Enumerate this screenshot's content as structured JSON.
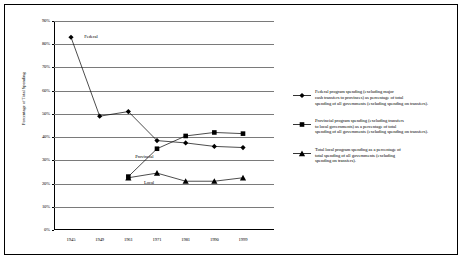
{
  "chart_data": {
    "type": "line",
    "title": "",
    "xlabel": "",
    "ylabel": "Percentage of Total Spending",
    "categories": [
      "1945",
      "1949",
      "1961",
      "1971",
      "1981",
      "1990",
      "1999"
    ],
    "ylim": [
      0,
      90
    ],
    "ytick_labels": [
      "0%",
      "10%",
      "20%",
      "30%",
      "40%",
      "50%",
      "60%",
      "70%",
      "80%",
      "90%"
    ],
    "ytick_values": [
      0,
      10,
      20,
      30,
      40,
      50,
      60,
      70,
      80,
      90
    ],
    "grid": "horizontal",
    "legend_position": "right",
    "series": [
      {
        "name": "Federal",
        "marker": "diamond",
        "values": [
          83,
          49,
          51,
          38.5,
          37.5,
          36,
          35.5
        ]
      },
      {
        "name": "Provincial",
        "marker": "square",
        "values": [
          null,
          null,
          23,
          35,
          40.5,
          42,
          41.5
        ]
      },
      {
        "name": "Local",
        "marker": "triangle",
        "values": [
          null,
          null,
          22.5,
          24.5,
          21,
          21,
          22.5
        ]
      }
    ],
    "annotations": [
      {
        "text": "Federal",
        "x": "1945",
        "y": 83
      },
      {
        "text": "Provincial",
        "x": "1968",
        "y": 31.5
      },
      {
        "text": "Local",
        "x": "1975",
        "y": 20.5
      }
    ]
  },
  "legend": {
    "entries": [
      {
        "marker": "diamond",
        "line1": "Federal program spending (excluding major",
        "line2": "cash transfers to provinces) as percentage of total",
        "line3": "spending of all governments (excluding spending on transfers)."
      },
      {
        "marker": "square",
        "line1": "Provincial program spending (excluding transfers",
        "line2": "to local governments) as a percentage of total",
        "line3": "spending of all governments (excluding spending on transfers)."
      },
      {
        "marker": "triangle",
        "line1": "Total local program spending as a percentage of",
        "line2": "total spending of all governments (excluding",
        "line3": "spending on transfers)."
      }
    ]
  },
  "colors": {
    "line": "#000000",
    "grid": "#7a7a7a",
    "axis": "#000000",
    "background": "#ffffff"
  }
}
